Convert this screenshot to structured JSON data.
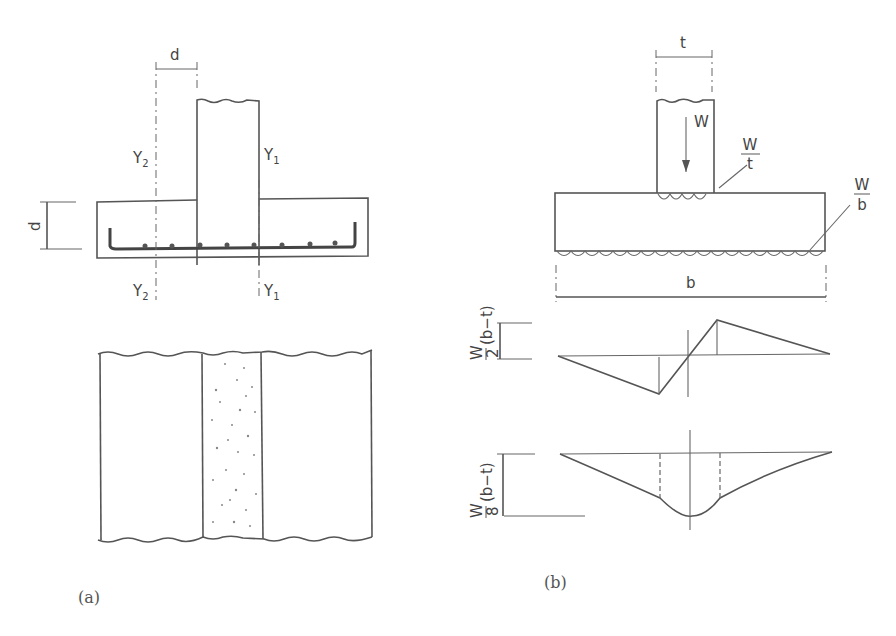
{
  "figure": {
    "panel_a": {
      "caption": "(a)",
      "section": {
        "dim_top_label": "d",
        "dim_left_label": "d",
        "section_lines": [
          {
            "label": "Y",
            "sub": "2",
            "position": "top-left"
          },
          {
            "label": "Y",
            "sub": "1",
            "position": "top-right"
          },
          {
            "label": "Y",
            "sub": "2",
            "position": "bottom-left"
          },
          {
            "label": "Y",
            "sub": "1",
            "position": "bottom-right"
          }
        ]
      },
      "plan": {
        "description": "plan view with stippled column strip"
      }
    },
    "panel_b": {
      "caption": "(b)",
      "load": {
        "column_width_label": "t",
        "load_label": "W",
        "column_pressure_num": "W",
        "column_pressure_den": "t",
        "base_pressure_num": "W",
        "base_pressure_den": "b",
        "base_width_label": "b"
      },
      "shear_diagram": {
        "label_num": "W",
        "label_den": "2",
        "label_expr": "(b−t)"
      },
      "moment_diagram": {
        "label_num": "W",
        "label_den": "8",
        "label_expr": "(b−t)"
      }
    }
  }
}
